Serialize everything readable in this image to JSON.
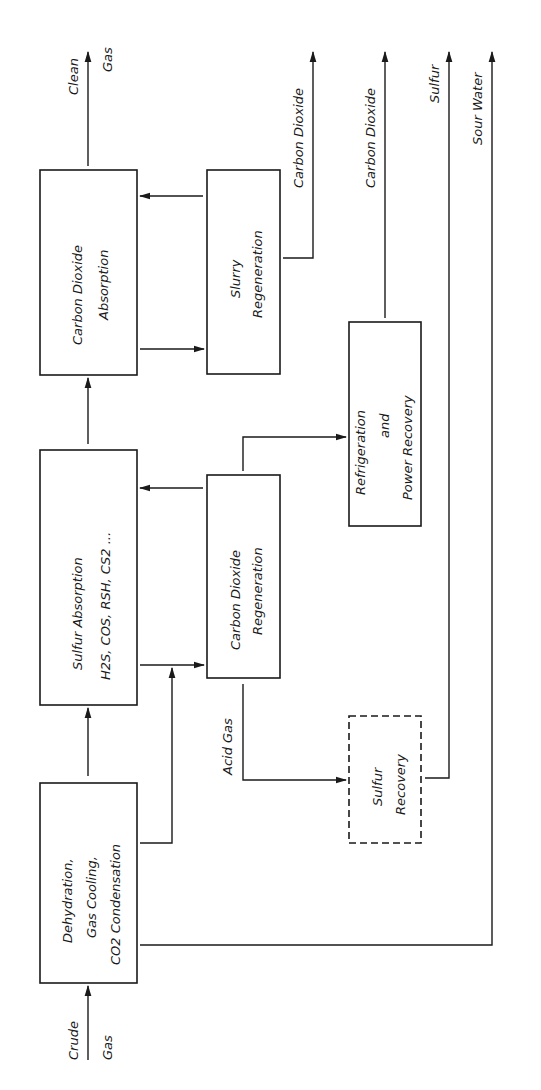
{
  "diagram": {
    "type": "process-flow",
    "orientation": "rotated-90-ccw",
    "input": {
      "line1": "Crude",
      "line2": "Gas"
    },
    "boxes": [
      {
        "id": "dehydration",
        "lines": [
          "Dehydration,",
          "Gas Cooling,",
          "CO2 Condensation"
        ],
        "style": "solid"
      },
      {
        "id": "sulfur-absorption",
        "lines": [
          "Sulfur Absorption",
          "H2S, COS, RSH, CS2 ..."
        ],
        "style": "solid"
      },
      {
        "id": "co2-absorption",
        "lines": [
          "Carbon Dioxide",
          "Absorption"
        ],
        "style": "solid"
      },
      {
        "id": "slurry-regeneration",
        "lines": [
          "Slurry",
          "Regeneration"
        ],
        "style": "solid"
      },
      {
        "id": "co2-regeneration",
        "lines": [
          "Carbon Dioxide",
          "Regeneration"
        ],
        "style": "solid"
      },
      {
        "id": "refrigeration",
        "lines": [
          "Refrigeration",
          "and",
          "Power Recovery"
        ],
        "style": "solid"
      },
      {
        "id": "sulfur-recovery",
        "lines": [
          "Sulfur",
          "Recovery"
        ],
        "style": "dashed"
      }
    ],
    "outputs": [
      {
        "line1": "Clean",
        "line2": "Gas"
      },
      {
        "label": "Carbon Dioxide"
      },
      {
        "label": "Carbon Dioxide"
      },
      {
        "label": "Sulfur"
      },
      {
        "label": "Sour Water"
      }
    ],
    "stream_labels": {
      "acid_gas": "Acid Gas"
    },
    "connections": [
      [
        "Crude Gas",
        "dehydration"
      ],
      [
        "dehydration",
        "sulfur-absorption"
      ],
      [
        "dehydration",
        "co2-regeneration"
      ],
      [
        "dehydration",
        "Sour Water"
      ],
      [
        "sulfur-absorption",
        "co2-absorption"
      ],
      [
        "sulfur-absorption",
        "co2-regeneration"
      ],
      [
        "co2-regeneration",
        "sulfur-absorption"
      ],
      [
        "co2-regeneration",
        "refrigeration"
      ],
      [
        "co2-regeneration",
        "sulfur-recovery",
        "Acid Gas"
      ],
      [
        "co2-absorption",
        "slurry-regeneration"
      ],
      [
        "slurry-regeneration",
        "co2-absorption"
      ],
      [
        "co2-absorption",
        "Clean Gas"
      ],
      [
        "slurry-regeneration",
        "Carbon Dioxide"
      ],
      [
        "refrigeration",
        "Carbon Dioxide"
      ],
      [
        "sulfur-recovery",
        "Sulfur"
      ]
    ]
  }
}
